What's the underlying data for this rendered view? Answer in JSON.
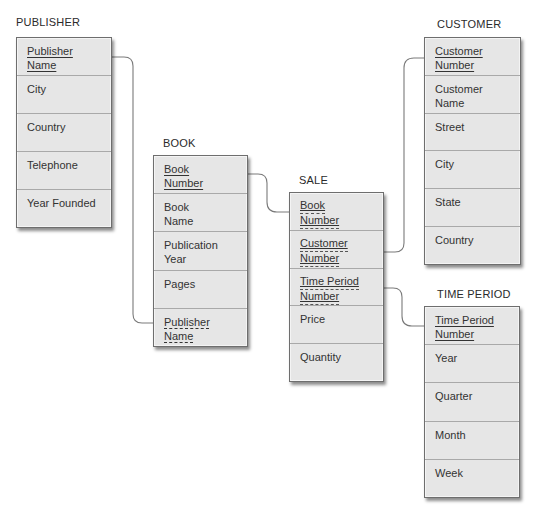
{
  "diagram": {
    "type": "relational-schema",
    "colors": {
      "entity_fill": "#e6e6e6",
      "entity_border": "#6e6e6e",
      "divider": "#a9a9a9",
      "connector": "#7a7a7a",
      "text": "#333333"
    },
    "entities": {
      "publisher": {
        "title": "PUBLISHER",
        "attributes": [
          {
            "lines": [
              "Publisher",
              "Name"
            ],
            "key": "pk"
          },
          {
            "lines": [
              "City"
            ],
            "key": "none"
          },
          {
            "lines": [
              "Country"
            ],
            "key": "none"
          },
          {
            "lines": [
              "Telephone"
            ],
            "key": "none"
          },
          {
            "lines": [
              "Year Founded"
            ],
            "key": "none"
          }
        ]
      },
      "book": {
        "title": "BOOK",
        "attributes": [
          {
            "lines": [
              "Book",
              "Number"
            ],
            "key": "pk"
          },
          {
            "lines": [
              "Book",
              "Name"
            ],
            "key": "none"
          },
          {
            "lines": [
              "Publication",
              "Year"
            ],
            "key": "none"
          },
          {
            "lines": [
              "Pages"
            ],
            "key": "none"
          },
          {
            "lines": [
              "Publisher",
              "Name"
            ],
            "key": "fk"
          }
        ]
      },
      "sale": {
        "title": "SALE",
        "attributes": [
          {
            "lines": [
              "Book",
              "Number"
            ],
            "key": "pk-fk"
          },
          {
            "lines": [
              "Customer",
              "Number"
            ],
            "key": "pk-fk"
          },
          {
            "lines": [
              "Time Period",
              "Number"
            ],
            "key": "pk-fk"
          },
          {
            "lines": [
              "Price"
            ],
            "key": "none"
          },
          {
            "lines": [
              "Quantity"
            ],
            "key": "none"
          }
        ]
      },
      "customer": {
        "title": "CUSTOMER",
        "attributes": [
          {
            "lines": [
              "Customer",
              "Number"
            ],
            "key": "pk"
          },
          {
            "lines": [
              "Customer",
              "Name"
            ],
            "key": "none"
          },
          {
            "lines": [
              "Street"
            ],
            "key": "none"
          },
          {
            "lines": [
              "City"
            ],
            "key": "none"
          },
          {
            "lines": [
              "State"
            ],
            "key": "none"
          },
          {
            "lines": [
              "Country"
            ],
            "key": "none"
          }
        ]
      },
      "time_period": {
        "title": "TIME PERIOD",
        "attributes": [
          {
            "lines": [
              "Time Period",
              "Number"
            ],
            "key": "pk"
          },
          {
            "lines": [
              "Year"
            ],
            "key": "none"
          },
          {
            "lines": [
              "Quarter"
            ],
            "key": "none"
          },
          {
            "lines": [
              "Month"
            ],
            "key": "none"
          },
          {
            "lines": [
              "Week"
            ],
            "key": "none"
          }
        ]
      }
    },
    "relationships": [
      {
        "from": "PUBLISHER.Publisher Name",
        "to": "BOOK.Publisher Name"
      },
      {
        "from": "BOOK.Book Number",
        "to": "SALE.Book Number"
      },
      {
        "from": "CUSTOMER.Customer Number",
        "to": "SALE.Customer Number"
      },
      {
        "from": "TIME PERIOD.Time Period Number",
        "to": "SALE.Time Period Number"
      }
    ]
  }
}
